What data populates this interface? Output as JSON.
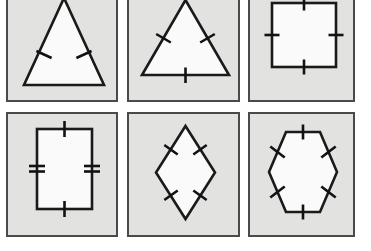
{
  "figure": {
    "title": "Polygons with congruence tick marks",
    "background_color": "#ffffff",
    "panel_background_color": "#e2e2e0",
    "panel_border_color": "#4a4a4a",
    "shape_stroke_color": "#1a1a1a",
    "shape_fill_color": "#fafafa",
    "tick_color": "#121212",
    "rows": 2,
    "columns": 3,
    "panel_count": 6
  },
  "panels": [
    {
      "index": 1,
      "position": "row-1-col-1",
      "shape_name": "isosceles-triangle",
      "label": "Isosceles triangle",
      "tick_marks": {
        "total": 2,
        "single_tick_sides": 2,
        "double_tick_sides": 0,
        "marked_sides": "two legs",
        "unmarked_sides": "base"
      },
      "notes": "Tall narrow triangle, apex clipped by top edge of image"
    },
    {
      "index": 2,
      "position": "row-1-col-2",
      "shape_name": "equilateral-triangle",
      "label": "Equilateral triangle",
      "tick_marks": {
        "total": 3,
        "single_tick_sides": 3,
        "double_tick_sides": 0,
        "marked_sides": "all three sides",
        "unmarked_sides": "none"
      },
      "notes": "Apex clipped by top edge of image"
    },
    {
      "index": 3,
      "position": "row-1-col-3",
      "shape_name": "square",
      "label": "Square",
      "tick_marks": {
        "total": 4,
        "single_tick_sides": 4,
        "double_tick_sides": 0,
        "marked_sides": "all four sides",
        "unmarked_sides": "none"
      },
      "notes": "Top edge of square clipped by top edge of image"
    },
    {
      "index": 4,
      "position": "row-2-col-1",
      "shape_name": "rectangle",
      "label": "Rectangle",
      "tick_marks": {
        "total": 4,
        "single_tick_sides": 2,
        "double_tick_sides": 2,
        "marked_sides": "top and bottom single tick, left and right double tick",
        "unmarked_sides": "none"
      },
      "notes": "Portrait orientation rectangle"
    },
    {
      "index": 5,
      "position": "row-2-col-2",
      "shape_name": "rhombus",
      "label": "Rhombus",
      "tick_marks": {
        "total": 4,
        "single_tick_sides": 4,
        "double_tick_sides": 0,
        "marked_sides": "all four sides",
        "unmarked_sides": "none"
      },
      "notes": "Tall vertical diamond"
    },
    {
      "index": 6,
      "position": "row-2-col-3",
      "shape_name": "regular-hexagon",
      "label": "Regular hexagon",
      "tick_marks": {
        "total": 6,
        "single_tick_sides": 6,
        "double_tick_sides": 0,
        "marked_sides": "all six sides",
        "unmarked_sides": "none"
      },
      "notes": "Flat-left/flat-right regular hexagon with horizontal top and bottom sides"
    }
  ]
}
